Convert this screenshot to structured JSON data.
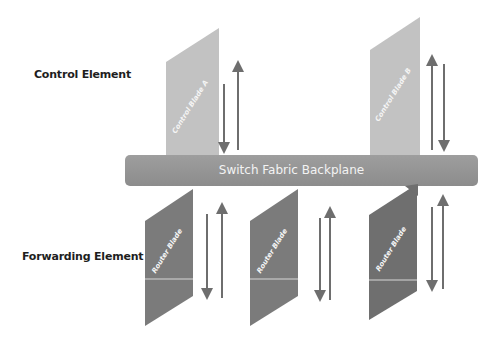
{
  "labels": {
    "control_element": "Control Element",
    "forwarding_element": "Forwarding Element"
  },
  "backplane": {
    "label": "Switch Fabric Backplane",
    "color": "#959595"
  },
  "control_blades": [
    {
      "label": "Control Blade A",
      "color": "#c2c2c2"
    },
    {
      "label": "Control Blade B",
      "color": "#c2c2c2"
    }
  ],
  "router_blades": [
    {
      "label": "Router Blade",
      "color": "#7b7b7b"
    },
    {
      "label": "Router Blade",
      "color": "#7b7b7b"
    },
    {
      "label": "Router Blade",
      "color": "#7b7b7b"
    }
  ],
  "arrows": {
    "description": "bidirectional vertical arrow pairs between each blade and the backplane",
    "color": "#6e6e6e"
  }
}
